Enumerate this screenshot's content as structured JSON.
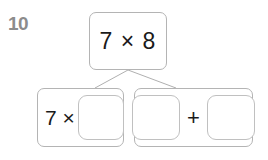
{
  "question": {
    "number": "10",
    "top_expression": "7 × 8",
    "left_branch": {
      "prefix": "7 ×",
      "answer_slot_value": ""
    },
    "right_branch": {
      "answer_slot_1_value": "",
      "operator": "+",
      "answer_slot_2_value": ""
    }
  },
  "colors": {
    "background": "#ffffff",
    "box_border": "#b4b4b4",
    "slot_border": "#c0c0c0",
    "text": "#1a1a1a",
    "question_number": "#8c8c8c",
    "connector_line": "#b0b0b0"
  }
}
